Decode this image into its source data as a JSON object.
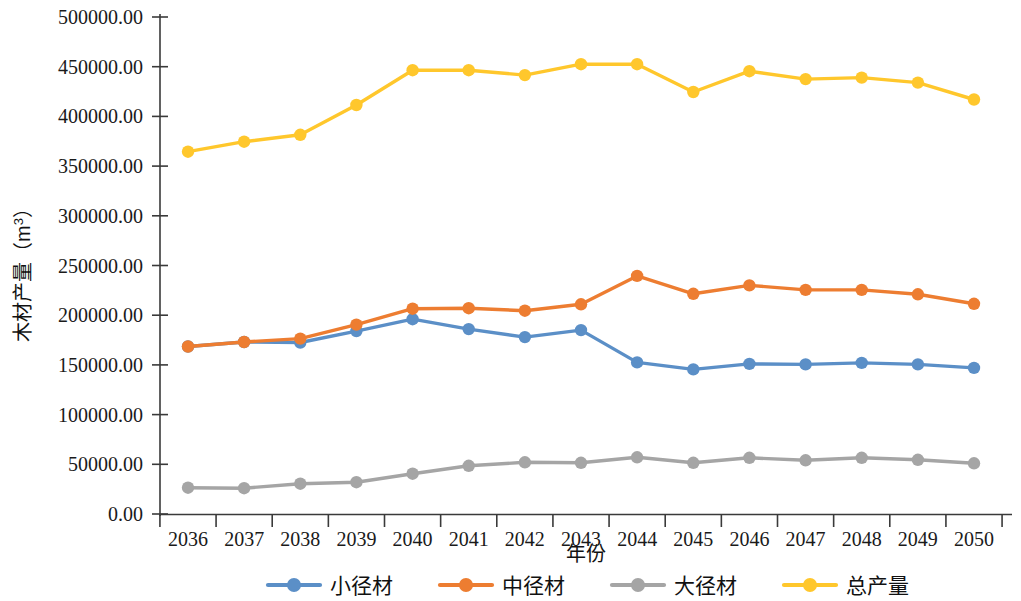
{
  "chart_data": {
    "type": "line",
    "title": "",
    "xlabel": "年份",
    "ylabel": "木材产量（m³）",
    "ylabel_parts": {
      "main": "木材产量（m",
      "superscript": "3",
      "tail": "）"
    },
    "categories": [
      "2036",
      "2037",
      "2038",
      "2039",
      "2040",
      "2041",
      "2042",
      "2043",
      "2044",
      "2045",
      "2046",
      "2047",
      "2048",
      "2049",
      "2050"
    ],
    "x": [
      2036,
      2037,
      2038,
      2039,
      2040,
      2041,
      2042,
      2043,
      2044,
      2045,
      2046,
      2047,
      2048,
      2049,
      2050
    ],
    "ylim": [
      0,
      500000
    ],
    "ytick_values": [
      0,
      50000,
      100000,
      150000,
      200000,
      250000,
      300000,
      350000,
      400000,
      450000,
      500000
    ],
    "ytick_labels": [
      "0.00",
      "50000.00",
      "100000.00",
      "150000.00",
      "200000.00",
      "250000.00",
      "300000.00",
      "350000.00",
      "400000.00",
      "450000.00",
      "500000.00"
    ],
    "grid": false,
    "legend_position": "bottom",
    "series": [
      {
        "name": "小径材",
        "color": "#5B8FC7",
        "values": [
          168500,
          173000,
          172500,
          184000,
          196000,
          186000,
          178000,
          185000,
          152500,
          145500,
          151000,
          150500,
          152000,
          150500,
          147000
        ]
      },
      {
        "name": "中径材",
        "color": "#ED7D31",
        "values": [
          168500,
          173000,
          176500,
          190500,
          206500,
          207000,
          204500,
          211000,
          239500,
          221500,
          230000,
          225500,
          225500,
          221000,
          211500
        ]
      },
      {
        "name": "大径材",
        "color": "#A5A5A5",
        "values": [
          26500,
          26000,
          30500,
          32000,
          40500,
          48500,
          52000,
          51500,
          57000,
          51500,
          56500,
          54000,
          56500,
          54500,
          51000
        ]
      },
      {
        "name": "总产量",
        "color": "#FFC72C",
        "values": [
          364500,
          374500,
          381500,
          411500,
          446500,
          446500,
          441500,
          452500,
          452500,
          424500,
          445500,
          437500,
          439000,
          434000,
          417000
        ]
      }
    ]
  },
  "legend": {
    "items": [
      {
        "label": "小径材",
        "color": "#5B8FC7"
      },
      {
        "label": "中径材",
        "color": "#ED7D31"
      },
      {
        "label": "大径材",
        "color": "#A5A5A5"
      },
      {
        "label": "总产量",
        "color": "#FFC72C"
      }
    ]
  },
  "axes": {
    "x_title": "年份",
    "y_title": "木材产量（m³）"
  }
}
